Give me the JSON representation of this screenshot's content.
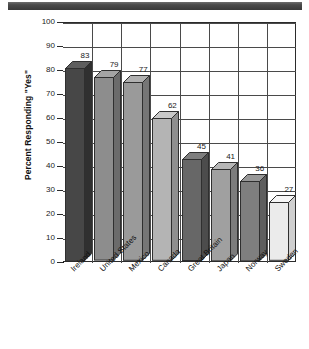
{
  "chart_data": {
    "type": "bar",
    "title": "",
    "subtitle": "",
    "xlabel": "",
    "ylabel": "Percent Responding \"Yes\"",
    "ylim": [
      0,
      100
    ],
    "ytick_step": 10,
    "grid": true,
    "legend": "none",
    "style": "3d-bars-grayscale",
    "categories": [
      "Ireland",
      "United States",
      "Mexico",
      "Canada",
      "Great Britain",
      "Japan",
      "Norway",
      "Sweden"
    ],
    "values": [
      83,
      79,
      77,
      62,
      45,
      41,
      36,
      27
    ],
    "value_labels": [
      "83",
      "79",
      "77",
      "62",
      "45",
      "41",
      "36",
      "27"
    ],
    "ytick_labels": [
      "100",
      "90",
      "80",
      "70",
      "60",
      "50",
      "40",
      "30",
      "20",
      "10",
      "0"
    ],
    "bar_colors": [
      "#474747",
      "#8d8d8d",
      "#9a9a9a",
      "#b4b4b4",
      "#676767",
      "#a0a0a0",
      "#7f7f7f",
      "#ebebeb"
    ],
    "bar_top_colors": [
      "#5e5e5e",
      "#a4a4a4",
      "#b0b0b0",
      "#c8c8c8",
      "#7e7e7e",
      "#b6b6b6",
      "#989898",
      "#f6f6f6"
    ],
    "bar_side_colors": [
      "#303030",
      "#6b6b6b",
      "#767676",
      "#8f8f8f",
      "#4c4c4c",
      "#7c7c7c",
      "#5e5e5e",
      "#cfcfcf"
    ]
  },
  "decor": {
    "top_band_color": "#4b4b4b"
  }
}
